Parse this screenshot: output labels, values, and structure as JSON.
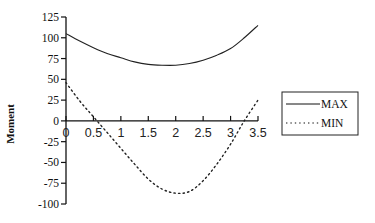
{
  "chart_data": {
    "type": "line",
    "title": "",
    "xlabel": "",
    "ylabel": "Moment",
    "x": [
      0,
      0.25,
      0.5,
      0.75,
      1.0,
      1.25,
      1.5,
      1.75,
      2.0,
      2.25,
      2.5,
      2.75,
      3.0,
      3.25,
      3.5
    ],
    "series": [
      {
        "name": "MAX",
        "style": "solid",
        "values": [
          105,
          96,
          88,
          81,
          76,
          71,
          68,
          67,
          67,
          69,
          73,
          79,
          87,
          100,
          115
        ]
      },
      {
        "name": "MIN",
        "style": "dotted",
        "values": [
          46,
          24,
          5,
          -14,
          -33,
          -52,
          -70,
          -82,
          -87,
          -85,
          -72,
          -52,
          -28,
          0,
          25
        ]
      }
    ],
    "xticks": [
      "0",
      "0.5",
      "1",
      "1.5",
      "2",
      "2.5",
      "3",
      "3.5"
    ],
    "yticks": [
      "125",
      "100",
      "75",
      "50",
      "25",
      "0",
      "-25",
      "-50",
      "-75",
      "-100"
    ],
    "xlim": [
      0,
      3.5
    ],
    "ylim": [
      -100,
      125
    ],
    "grid": false,
    "legend_position": "right"
  },
  "legend": {
    "items": [
      {
        "label": "MAX"
      },
      {
        "label": "MIN"
      }
    ]
  }
}
